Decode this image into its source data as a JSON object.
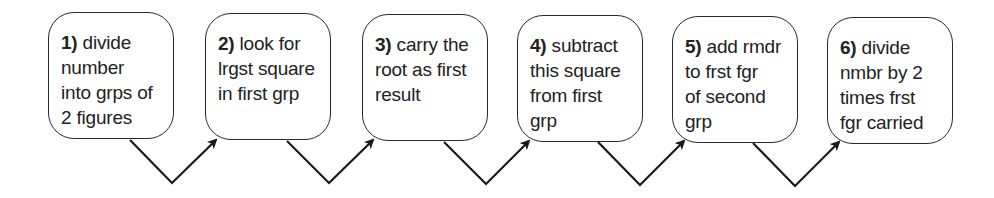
{
  "diagram": {
    "type": "process-flow",
    "steps": [
      {
        "number": "1)",
        "lines": [
          "divide",
          "number",
          "into grps of",
          "2 figures"
        ]
      },
      {
        "number": "2)",
        "lines": [
          "look for",
          "lrgst square",
          "in first grp"
        ]
      },
      {
        "number": "3)",
        "lines": [
          "carry the",
          "root as first",
          "result"
        ]
      },
      {
        "number": "4)",
        "lines": [
          "subtract",
          "this square",
          "from first",
          "grp"
        ]
      },
      {
        "number": "5)",
        "lines": [
          "add rmdr",
          "to frst fgr",
          "of second",
          "grp"
        ]
      },
      {
        "number": "6)",
        "lines": [
          "divide",
          "nmbr by 2",
          "times frst",
          "fgr carried"
        ]
      }
    ],
    "connectors": [
      {
        "from": 1,
        "to": 2,
        "style": "v-shaped-arrow"
      },
      {
        "from": 2,
        "to": 3,
        "style": "v-shaped-arrow"
      },
      {
        "from": 3,
        "to": 4,
        "style": "v-shaped-arrow"
      },
      {
        "from": 4,
        "to": 5,
        "style": "v-shaped-arrow"
      },
      {
        "from": 5,
        "to": 6,
        "style": "v-shaped-arrow"
      }
    ],
    "colors": {
      "stroke": "#1a1a1a",
      "text": "#222222",
      "background": "#ffffff"
    }
  }
}
